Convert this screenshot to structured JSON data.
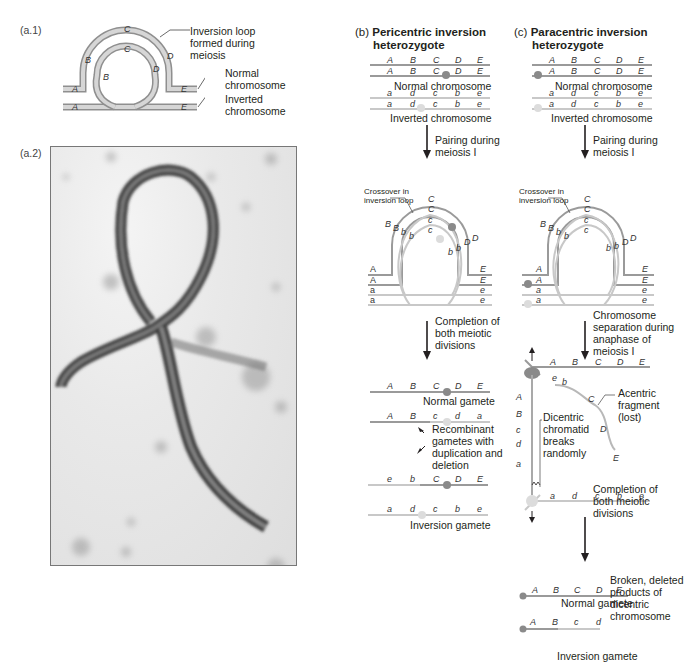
{
  "panel_a1": {
    "label": "(a.1)",
    "callouts": {
      "loop": "Inversion loop formed during meiosis",
      "normal": "Normal chromosome",
      "inverted": "Inverted chromosome"
    },
    "outer_genes": [
      "A",
      "B",
      "C",
      "D",
      "E"
    ],
    "inner_genes": [
      "A",
      "B",
      "C",
      "D",
      "E"
    ]
  },
  "panel_a2": {
    "label": "(a.2)",
    "description": "electron micrograph of inversion loop"
  },
  "panel_b": {
    "letter": "(b)",
    "title_line1": "Pericentric inversion",
    "title_line2": "heterozygote",
    "normal_chromosome": {
      "genes": [
        "A",
        "B",
        "C",
        "D",
        "E"
      ],
      "caption": "Normal chromosome"
    },
    "inverted_chromosome": {
      "genes": [
        "a",
        "d",
        "c",
        "b",
        "e"
      ],
      "caption": "Inverted chromosome"
    },
    "step1": "Pairing during meiosis I",
    "crossover_label": "Crossover in inversion loop",
    "step2": "Completion of both meiotic divisions",
    "gametes": [
      {
        "genes": [
          "A",
          "B",
          "C",
          "D",
          "E"
        ],
        "caption": "Normal gamete"
      },
      {
        "genes": [
          "A",
          "B",
          "c",
          "d",
          "a"
        ],
        "caption": ""
      },
      {
        "genes": [
          "e",
          "b",
          "C",
          "D",
          "E"
        ],
        "caption": ""
      },
      {
        "genes": [
          "a",
          "d",
          "c",
          "b",
          "e"
        ],
        "caption": "Inversion gamete"
      }
    ],
    "recombinant_label": "Recombinant gametes with duplication and deletion"
  },
  "panel_c": {
    "letter": "(c)",
    "title_line1": "Paracentric inversion",
    "title_line2": "heterozygote",
    "normal_chromosome": {
      "genes": [
        "A",
        "B",
        "C",
        "D",
        "E"
      ],
      "caption": "Normal chromosome"
    },
    "inverted_chromosome": {
      "genes": [
        "a",
        "d",
        "c",
        "b",
        "e"
      ],
      "caption": "Inverted chromosome"
    },
    "step1": "Pairing during meiosis I",
    "crossover_label": "Crossover in inversion loop",
    "step2": "Chromosome separation during anaphase of meiosis I",
    "acentric_label": "Acentric fragment (lost)",
    "dicentric_label": "Dicentric chromatid breaks randomly",
    "step3": "Completion of both meiotic divisions",
    "gametes": [
      {
        "genes": [
          "A",
          "B",
          "C",
          "D",
          "E"
        ],
        "caption": "Normal gamete"
      },
      {
        "genes": [
          "A",
          "B",
          "c",
          "d"
        ],
        "caption": ""
      },
      {
        "genes": [
          "a"
        ],
        "caption": ""
      },
      {
        "genes": [
          "a",
          "d",
          "c",
          "b",
          "e"
        ],
        "caption": "Inversion gamete"
      }
    ],
    "broken_label": "Broken, deleted products of dicentric chromosome"
  },
  "colors": {
    "normal_strand": "#9a9a9a",
    "inverted_strand": "#c8c8c8",
    "arrow": "#231f20",
    "text": "#231f20"
  }
}
